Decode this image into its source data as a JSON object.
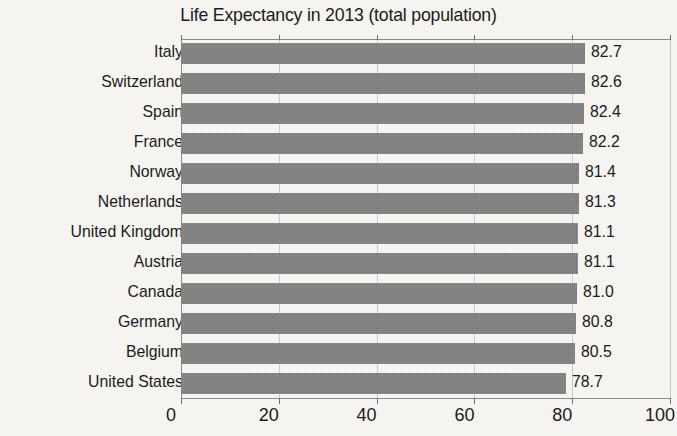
{
  "chart_data": {
    "type": "bar",
    "orientation": "horizontal",
    "title": "Life Expectancy in 2013 (total population)",
    "xlabel": "",
    "ylabel": "",
    "xlim": [
      0,
      100
    ],
    "xticks": [
      0,
      20,
      40,
      60,
      80,
      100
    ],
    "xtick_labels": [
      "0",
      "20",
      "40",
      "60",
      "80",
      "100"
    ],
    "grid": true,
    "legend": false,
    "bar_color": "#808080",
    "background_color": "#f5f4f1",
    "text_color": "#1b1b1b",
    "categories": [
      "Italy",
      "Switzerland",
      "Spain",
      "France",
      "Norway",
      "Netherlands",
      "United Kingdom",
      "Austria",
      "Canada",
      "Germany",
      "Belgium",
      "United States"
    ],
    "values": [
      82.7,
      82.6,
      82.4,
      82.2,
      81.4,
      81.3,
      81.1,
      81.1,
      81.0,
      80.8,
      80.5,
      78.7
    ],
    "data_labels": [
      "82.7",
      "82.6",
      "82.4",
      "82.2",
      "81.4",
      "81.3",
      "81.1",
      "81.1",
      "81.0",
      "80.8",
      "80.5",
      "78.7"
    ]
  }
}
